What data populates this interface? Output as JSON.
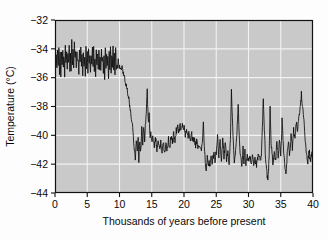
{
  "chart_data": {
    "type": "line",
    "title": "",
    "subtitle": "",
    "xlabel": "Thousands of years before present",
    "ylabel": "Temperature (°C)",
    "xlim": [
      0,
      40
    ],
    "ylim": [
      -44,
      -32
    ],
    "xticks": [
      0,
      5,
      10,
      15,
      20,
      25,
      30,
      35,
      40
    ],
    "xtick_labels": [
      "0",
      "5",
      "10",
      "15",
      "20",
      "25",
      "30",
      "35",
      "40"
    ],
    "yticks": [
      -44,
      -42,
      -40,
      -38,
      -36,
      -34,
      -32
    ],
    "ytick_labels": [
      "−44",
      "−42",
      "−40",
      "−38",
      "−36",
      "−34",
      "−32"
    ],
    "grid": true,
    "grid_color": "#f2f2f2",
    "plot_bg_color": "#c9c9c9",
    "line_color": "#0d0d0d",
    "legend": null,
    "legend_position": "none",
    "annotations": [],
    "series": [
      {
        "name": "Ice core temperature",
        "x": [
          0.0,
          0.1,
          0.2,
          0.3,
          0.4,
          0.5,
          0.6,
          0.7,
          0.8,
          0.9,
          1.0,
          1.1,
          1.2,
          1.3,
          1.4,
          1.5,
          1.6,
          1.7,
          1.8,
          1.9,
          2.0,
          2.1,
          2.2,
          2.3,
          2.4,
          2.5,
          2.6,
          2.7,
          2.8,
          2.9,
          3.0,
          3.1,
          3.2,
          3.3,
          3.4,
          3.5,
          3.6,
          3.7,
          3.8,
          3.9,
          4.0,
          4.1,
          4.2,
          4.3,
          4.4,
          4.5,
          4.6,
          4.7,
          4.8,
          4.9,
          5.0,
          5.1,
          5.2,
          5.3,
          5.4,
          5.5,
          5.6,
          5.7,
          5.8,
          5.9,
          6.0,
          6.1,
          6.2,
          6.3,
          6.4,
          6.5,
          6.6,
          6.7,
          6.8,
          6.9,
          7.0,
          7.1,
          7.2,
          7.3,
          7.4,
          7.5,
          7.6,
          7.7,
          7.8,
          7.9,
          8.0,
          8.1,
          8.2,
          8.3,
          8.4,
          8.5,
          8.6,
          8.7,
          8.8,
          8.9,
          9.0,
          9.1,
          9.2,
          9.3,
          9.4,
          9.5,
          9.6,
          9.7,
          9.8,
          9.9,
          10.0,
          10.2,
          10.4,
          10.6,
          10.8,
          11.0,
          11.2,
          11.4,
          11.6,
          11.8,
          12.0,
          12.15,
          12.3,
          12.45,
          12.6,
          12.75,
          12.9,
          13.0,
          13.15,
          13.3,
          13.45,
          13.6,
          13.75,
          13.9,
          14.0,
          14.15,
          14.3,
          14.45,
          14.6,
          14.75,
          14.9,
          15.0,
          15.2,
          15.4,
          15.6,
          15.8,
          16.0,
          16.2,
          16.4,
          16.6,
          16.8,
          17.0,
          17.2,
          17.4,
          17.6,
          17.8,
          18.0,
          18.2,
          18.4,
          18.6,
          18.8,
          19.0,
          19.2,
          19.4,
          19.6,
          19.8,
          20.0,
          20.2,
          20.4,
          20.6,
          20.8,
          21.0,
          21.2,
          21.4,
          21.6,
          21.8,
          22.0,
          22.2,
          22.4,
          22.6,
          22.8,
          23.0,
          23.15,
          23.3,
          23.45,
          23.6,
          23.75,
          23.9,
          24.0,
          24.2,
          24.4,
          24.6,
          24.8,
          25.0,
          25.2,
          25.4,
          25.6,
          25.8,
          26.0,
          26.2,
          26.4,
          26.6,
          26.8,
          27.0,
          27.2,
          27.35,
          27.5,
          27.65,
          27.8,
          28.0,
          28.2,
          28.4,
          28.6,
          28.8,
          29.0,
          29.15,
          29.3,
          29.45,
          29.6,
          29.8,
          30.0,
          30.2,
          30.4,
          30.6,
          30.8,
          31.0,
          31.2,
          31.4,
          31.6,
          31.8,
          32.0,
          32.15,
          32.3,
          32.45,
          32.6,
          32.8,
          33.0,
          33.2,
          33.35,
          33.5,
          33.65,
          33.8,
          34.0,
          34.2,
          34.4,
          34.6,
          34.8,
          35.0,
          35.2,
          35.4,
          35.6,
          35.8,
          36.0,
          36.2,
          36.4,
          36.6,
          36.8,
          37.0,
          37.2,
          37.4,
          37.6,
          37.8,
          38.0,
          38.2,
          38.4,
          38.6,
          38.8,
          39.0,
          39.2,
          39.4,
          39.6,
          39.8,
          40.0
        ],
        "y": [
          -36.3,
          -35.2,
          -34.3,
          -35.5,
          -34.1,
          -35.3,
          -34.0,
          -35.6,
          -34.4,
          -35.9,
          -34.2,
          -35.4,
          -33.9,
          -35.1,
          -34.6,
          -35.8,
          -34.0,
          -35.2,
          -34.5,
          -35.5,
          -34.1,
          -35.0,
          -33.8,
          -35.3,
          -34.4,
          -35.6,
          -33.6,
          -34.9,
          -34.2,
          -35.4,
          -33.3,
          -34.8,
          -34.1,
          -35.5,
          -34.0,
          -35.1,
          -34.6,
          -35.7,
          -34.2,
          -35.0,
          -33.7,
          -35.2,
          -34.5,
          -35.6,
          -34.0,
          -35.3,
          -34.3,
          -35.8,
          -34.1,
          -35.1,
          -34.4,
          -35.5,
          -33.9,
          -35.0,
          -34.7,
          -35.9,
          -34.2,
          -35.3,
          -34.0,
          -35.2,
          -33.8,
          -35.4,
          -34.5,
          -35.7,
          -34.1,
          -35.0,
          -34.3,
          -35.6,
          -33.9,
          -35.2,
          -34.6,
          -35.8,
          -34.0,
          -35.1,
          -34.4,
          -35.5,
          -34.2,
          -35.9,
          -33.7,
          -35.3,
          -34.1,
          -35.0,
          -34.8,
          -36.2,
          -34.3,
          -35.4,
          -34.0,
          -35.6,
          -34.5,
          -35.1,
          -33.8,
          -35.3,
          -34.4,
          -35.8,
          -34.1,
          -35.5,
          -34.9,
          -35.2,
          -34.6,
          -35.4,
          -35.1,
          -35.4,
          -35.3,
          -35.8,
          -36.0,
          -36.4,
          -36.9,
          -37.4,
          -38.0,
          -38.6,
          -39.3,
          -40.1,
          -40.9,
          -41.6,
          -40.2,
          -41.3,
          -40.0,
          -41.8,
          -40.4,
          -41.1,
          -39.6,
          -40.5,
          -39.2,
          -40.3,
          -39.5,
          -38.4,
          -37.0,
          -39.0,
          -38.6,
          -40.2,
          -39.9,
          -40.6,
          -40.0,
          -40.7,
          -40.2,
          -40.9,
          -40.4,
          -41.0,
          -40.5,
          -41.2,
          -40.6,
          -41.1,
          -40.5,
          -41.0,
          -40.3,
          -40.8,
          -40.2,
          -40.6,
          -39.9,
          -40.4,
          -39.7,
          -39.4,
          -39.8,
          -39.3,
          -39.6,
          -39.2,
          -39.5,
          -39.9,
          -39.6,
          -40.1,
          -39.8,
          -40.3,
          -40.0,
          -40.5,
          -40.2,
          -40.7,
          -40.4,
          -40.9,
          -40.6,
          -41.0,
          -40.7,
          -39.1,
          -40.6,
          -41.8,
          -42.6,
          -41.4,
          -42.0,
          -41.6,
          -42.2,
          -41.5,
          -41.9,
          -41.3,
          -41.7,
          -41.2,
          -40.0,
          -41.5,
          -40.4,
          -41.6,
          -40.3,
          -41.4,
          -40.6,
          -41.7,
          -41.0,
          -41.9,
          -40.2,
          -36.9,
          -38.6,
          -40.5,
          -41.8,
          -41.2,
          -39.8,
          -38.1,
          -40.6,
          -41.5,
          -42.1,
          -40.8,
          -41.9,
          -41.2,
          -42.0,
          -41.5,
          -41.8,
          -41.3,
          -41.9,
          -41.4,
          -42.0,
          -41.6,
          -42.1,
          -41.7,
          -41.2,
          -41.8,
          -41.4,
          -39.3,
          -37.5,
          -39.4,
          -41.2,
          -42.4,
          -43.1,
          -41.6,
          -38.2,
          -40.3,
          -41.4,
          -42.0,
          -41.1,
          -41.8,
          -40.4,
          -41.5,
          -40.2,
          -41.6,
          -39.0,
          -40.8,
          -42.0,
          -42.9,
          -41.3,
          -40.5,
          -41.4,
          -40.0,
          -40.9,
          -39.6,
          -40.4,
          -39.2,
          -39.8,
          -38.8,
          -38.2,
          -37.1,
          -38.0,
          -38.9,
          -40.2,
          -41.5,
          -41.8,
          -41.0,
          -41.9,
          -41.3,
          -41.6
        ]
      }
    ]
  },
  "figure": {
    "plot_left": 55,
    "plot_top": 20,
    "plot_right": 313,
    "plot_bottom": 193
  }
}
